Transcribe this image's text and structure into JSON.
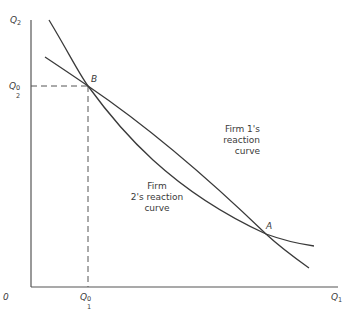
{
  "diagram": {
    "type": "reaction-curves",
    "axes": {
      "y_label": {
        "base": "Q",
        "sub": "2"
      },
      "x_label": {
        "base": "Q",
        "sub": "1"
      },
      "origin_label": "0"
    },
    "tick_labels": {
      "y_equilibrium": {
        "base": "Q",
        "sub": "2",
        "sup": "0"
      },
      "x_equilibrium": {
        "base": "Q",
        "sub": "1",
        "sup": "0"
      }
    },
    "points": [
      {
        "label": "B",
        "x": 88,
        "y": 86
      },
      {
        "label": "A",
        "x": 266,
        "y": 234
      }
    ],
    "curves": [
      {
        "name": "Firm 1's reaction curve",
        "lines": [
          "Firm 1's",
          "reaction",
          "curve"
        ]
      },
      {
        "name": "Firm 2's reaction curve",
        "lines": [
          "Firm",
          "2's reaction",
          "curve"
        ]
      }
    ],
    "colors": {
      "line": "#3a3a3a",
      "axis": "#555555",
      "background": "#ffffff"
    }
  }
}
